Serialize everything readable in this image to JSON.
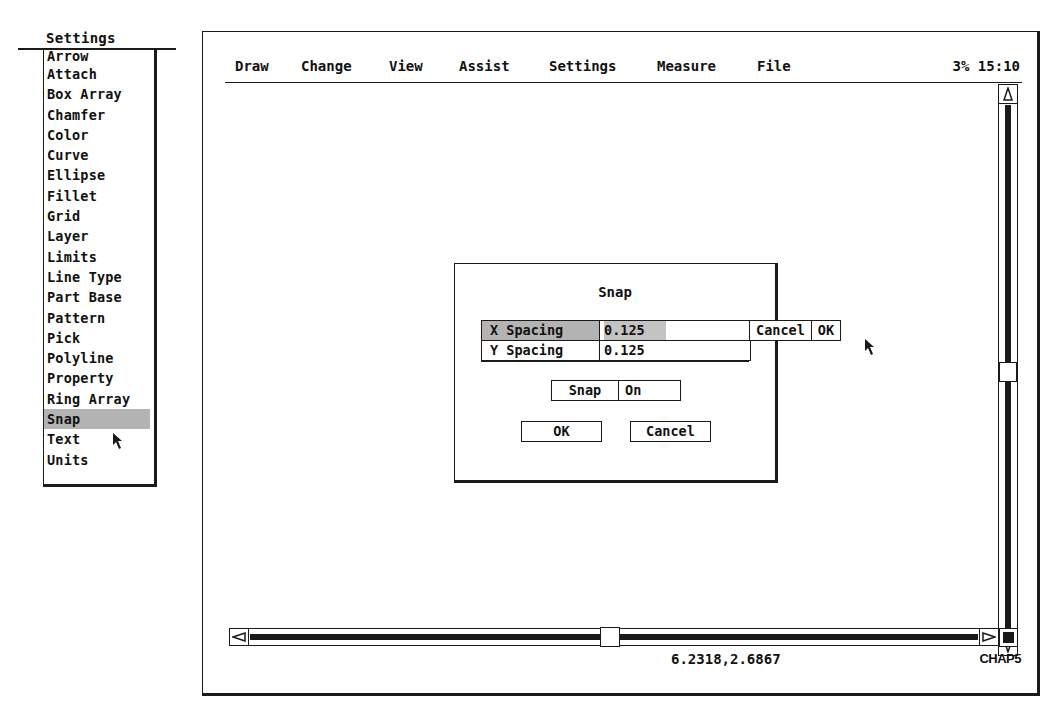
{
  "settings_menu": {
    "title": "Settings",
    "items": [
      {
        "label": "Arrow"
      },
      {
        "label": "Attach"
      },
      {
        "label": "Box Array"
      },
      {
        "label": "Chamfer"
      },
      {
        "label": "Color"
      },
      {
        "label": "Curve"
      },
      {
        "label": "Ellipse"
      },
      {
        "label": "Fillet"
      },
      {
        "label": "Grid"
      },
      {
        "label": "Layer"
      },
      {
        "label": "Limits"
      },
      {
        "label": "Line Type"
      },
      {
        "label": "Part Base"
      },
      {
        "label": "Pattern"
      },
      {
        "label": "Pick"
      },
      {
        "label": "Polyline"
      },
      {
        "label": "Property"
      },
      {
        "label": "Ring Array"
      },
      {
        "label": "Snap",
        "selected": true
      },
      {
        "label": "Text"
      },
      {
        "label": "Units"
      }
    ]
  },
  "menubar": {
    "items": [
      {
        "label": "Draw"
      },
      {
        "label": "Change"
      },
      {
        "label": "View"
      },
      {
        "label": "Assist"
      },
      {
        "label": "Settings"
      },
      {
        "label": "Measure"
      },
      {
        "label": "File"
      }
    ],
    "memory_percent": "3%",
    "clock": "15:10"
  },
  "dialog": {
    "title": "Snap",
    "fields": [
      {
        "label": "X Spacing",
        "value": "0.125",
        "active": true
      },
      {
        "label": "Y Spacing",
        "value": "0.125",
        "active": false
      }
    ],
    "inline_cancel": "Cancel",
    "inline_ok": "OK",
    "snap_label": "Snap",
    "snap_value": "On",
    "ok_label": "OK",
    "cancel_label": "Cancel"
  },
  "status": {
    "coordinates": "6.2318,2.6867",
    "drawing_name": "CHAP5"
  },
  "colors": {
    "ink": "#1a1a1a",
    "background": "#ffffff",
    "highlight": "#c9c9c9"
  }
}
